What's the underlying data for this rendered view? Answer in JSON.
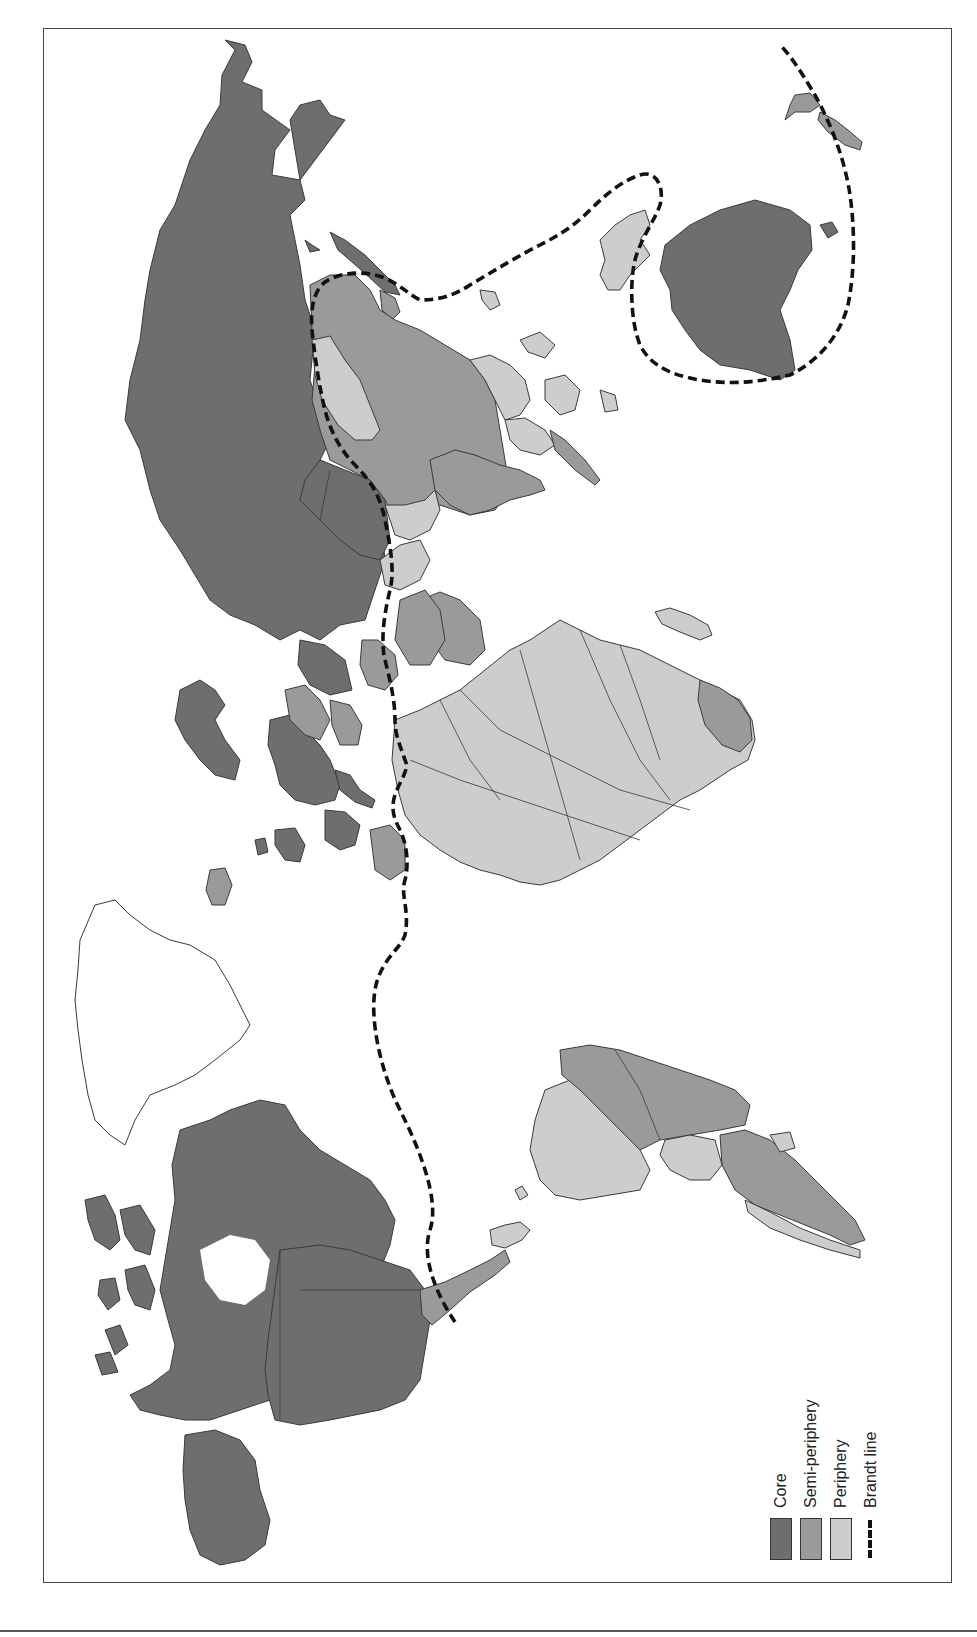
{
  "map": {
    "title": "",
    "orientation": "rotated 90° clockwise (north to the left)",
    "colors": {
      "core": "#6e6e6e",
      "semi_periphery": "#9a9a9a",
      "periphery": "#cdcdcd",
      "unclassified": "#ffffff",
      "brandt_line": "#111111"
    }
  },
  "legend": {
    "items": [
      {
        "key": "core",
        "label": "Core",
        "swatch": "#6e6e6e"
      },
      {
        "key": "semi_periphery",
        "label": "Semi-periphery",
        "swatch": "#9a9a9a"
      },
      {
        "key": "periphery",
        "label": "Periphery",
        "swatch": "#cdcdcd"
      },
      {
        "key": "brandt_line",
        "label": "Brandt line",
        "swatch": "dashed-line"
      }
    ]
  },
  "regions": {
    "core": [
      "Canada",
      "United States",
      "Western Europe",
      "Russia",
      "Japan",
      "Australia",
      "New Zealand"
    ],
    "semi_periphery": [
      "Mexico",
      "Brazil",
      "Argentina",
      "China",
      "India",
      "Saudi Arabia",
      "South Africa",
      "Indonesia",
      "Eastern Europe"
    ],
    "periphery": [
      "Most of Africa",
      "Central America",
      "Andean South America",
      "Mongolia",
      "Southeast Asia",
      "Papua New Guinea",
      "Madagascar"
    ],
    "unclassified": [
      "Greenland"
    ]
  }
}
